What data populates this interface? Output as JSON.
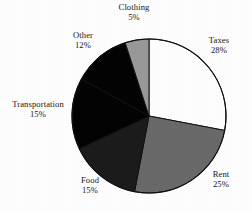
{
  "chart_data": {
    "type": "pie",
    "title": "",
    "subtitle": "",
    "xlabel": "",
    "ylabel": "",
    "grid": false,
    "legend_position": "none",
    "label_format": "name-above-percent",
    "start_angle_deg": 0,
    "direction": "clockwise",
    "categories": [
      "Taxes",
      "Rent",
      "Food",
      "Transportation",
      "Other",
      "Clothing"
    ],
    "values": [
      28,
      25,
      15,
      15,
      12,
      5
    ],
    "value_unit": "%",
    "slices": [
      {
        "label": "Taxes",
        "percent": 28,
        "percent_text": "28%",
        "color": "#ffffff",
        "stroke": "#111111"
      },
      {
        "label": "Rent",
        "percent": 25,
        "percent_text": "25%",
        "color": "#6a6a6a",
        "stroke": "#111111"
      },
      {
        "label": "Food",
        "percent": 15,
        "percent_text": "15%",
        "color": "#1c1c1c",
        "stroke": "#111111"
      },
      {
        "label": "Transportation",
        "percent": 15,
        "percent_text": "15%",
        "color": "#040404",
        "stroke": "#111111"
      },
      {
        "label": "Other",
        "percent": 12,
        "percent_text": "12%",
        "color": "#040404",
        "stroke": "#111111"
      },
      {
        "label": "Clothing",
        "percent": 5,
        "percent_text": "5%",
        "color": "#9a9a9a",
        "stroke": "#111111"
      }
    ]
  },
  "labels": {
    "taxes": {
      "name": "Taxes",
      "percent": "28%"
    },
    "rent": {
      "name": "Rent",
      "percent": "25%"
    },
    "food": {
      "name": "Food",
      "percent": "15%"
    },
    "transportation": {
      "name": "Transportation",
      "percent": "15%"
    },
    "other": {
      "name": "Other",
      "percent": "12%"
    },
    "clothing": {
      "name": "Clothing",
      "percent": "5%"
    }
  },
  "geometry": {
    "center_x": 149,
    "center_y": 116,
    "radius": 77
  },
  "colors": {
    "background": "#ffffff",
    "outline": "#111111",
    "text": "#181818"
  }
}
